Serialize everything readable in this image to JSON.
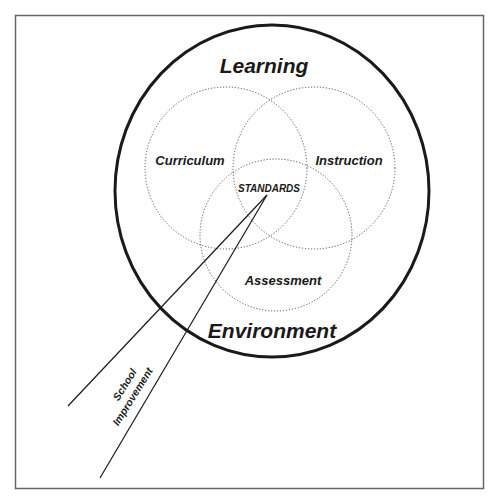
{
  "diagram": {
    "title": "Learning Environment",
    "outer_labels": {
      "top": "Learning",
      "bottom": "Environment"
    },
    "circles": [
      {
        "id": "curriculum",
        "label": "Curriculum"
      },
      {
        "id": "instruction",
        "label": "Instruction"
      },
      {
        "id": "assessment",
        "label": "Assessment"
      }
    ],
    "center_label": "STANDARDS",
    "pointer": {
      "label_line1": "School",
      "label_line2": "Improvement"
    },
    "colors": {
      "stroke": "#1a1a1a",
      "dotted": "#555555",
      "frame": "#666666",
      "background": "#ffffff"
    }
  }
}
